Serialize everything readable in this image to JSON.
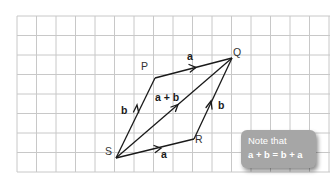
{
  "diagram": {
    "grid": {
      "x0": 17,
      "y0": 16,
      "cell": 19.5,
      "cols": 16,
      "rows": 8,
      "color": "#c8c8c8"
    },
    "points": {
      "S": {
        "label": "S",
        "x": 116,
        "y": 158
      },
      "P": {
        "label": "P",
        "x": 155,
        "y": 78
      },
      "Q": {
        "label": "Q",
        "x": 232,
        "y": 58
      },
      "R": {
        "label": "R",
        "x": 194,
        "y": 139
      }
    },
    "vectors": [
      {
        "from": "S",
        "to": "P",
        "label": "b"
      },
      {
        "from": "P",
        "to": "Q",
        "label": "a"
      },
      {
        "from": "S",
        "to": "R",
        "label": "a"
      },
      {
        "from": "R",
        "to": "Q",
        "label": "b"
      },
      {
        "from": "S",
        "to": "Q",
        "label": "a + b"
      }
    ],
    "labels": {
      "P": "P",
      "Q": "Q",
      "R": "R",
      "S": "S",
      "vec_PQ": "a",
      "vec_SP": "b",
      "vec_SR": "a",
      "vec_RQ": "b",
      "vec_SQ": "a + b"
    },
    "line_color": "#1a1a1a"
  },
  "note": {
    "line1": "Note that",
    "line2": "a + b = b + a",
    "background": "#a6a6a6"
  }
}
